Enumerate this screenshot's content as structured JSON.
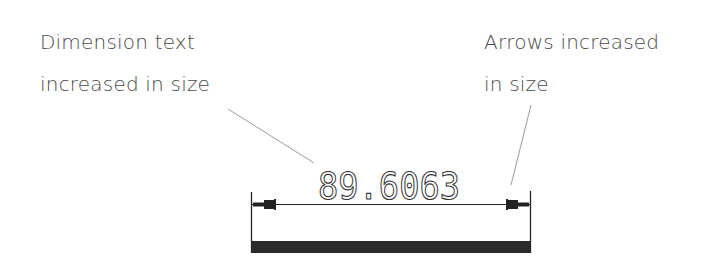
{
  "annotations": {
    "left": {
      "line1": "Dimension text",
      "line2": "increased in size"
    },
    "right": {
      "line1": "Arrows increased",
      "line2": "in size"
    }
  },
  "dimension": {
    "value": "89.6063"
  },
  "colors": {
    "text": "#4a4a4a",
    "drawing": "#222222",
    "leader": "#9a9a9a",
    "bar": "#2b2b2b"
  }
}
